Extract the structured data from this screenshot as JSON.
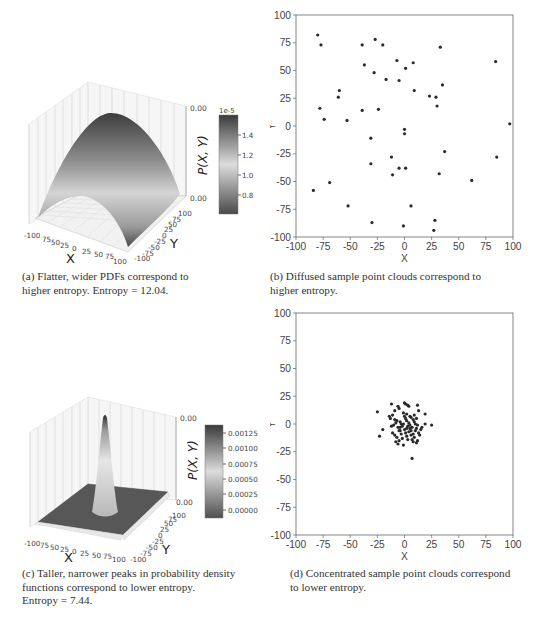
{
  "figure": {
    "panels": [
      {
        "id": "a",
        "caption": "(a) Flatter, wider PDFs correspond to higher entropy. Entropy = 12.04.",
        "caption_lines": [
          "(a) Flatter, wider PDFs correspond to",
          "higher entropy. Entropy = 12.04."
        ]
      },
      {
        "id": "b",
        "caption": "(b) Diffused sample point clouds correspond to higher entropy.",
        "caption_lines": [
          "(b) Diffused sample point clouds correspond to",
          "higher entropy."
        ]
      },
      {
        "id": "c",
        "caption": "(c) Taller, narrower peaks in probability density functions correspond to lower entropy. Entropy = 7.44.",
        "caption_lines": [
          "(c) Taller, narrower peaks in probability density",
          "functions correspond to lower entropy.",
          "Entropy = 7.44."
        ]
      },
      {
        "id": "d",
        "caption": "(d) Concentrated sample point clouds correspond to lower entropy.",
        "caption_lines": [
          "(d) Concentrated sample point clouds correspond",
          "to lower entropy."
        ]
      }
    ]
  },
  "chart_data": [
    {
      "panel": "a",
      "type": "surface3d",
      "title": "",
      "xlabel": "X",
      "ylabel": "Y",
      "zlabel_colorbar": "P(X, Y)",
      "x_ticks": [
        "-100",
        "75",
        "50",
        "25",
        "0",
        "25",
        "50",
        "75",
        "100"
      ],
      "y_ticks": [
        "-100",
        "-75",
        "-50",
        "-25",
        "0",
        "25",
        "50",
        "75",
        "100"
      ],
      "z_ticks": [
        "0.00",
        "0.00"
      ],
      "colorbar": {
        "offset_label": "1e-5",
        "ticks": [
          "1.4",
          "1.2",
          "1.0",
          "0.8"
        ],
        "range": [
          0.65,
          1.57
        ]
      },
      "description": "Broad Gaussian-like dome over [-100,100]^2"
    },
    {
      "panel": "b",
      "type": "scatter",
      "title": "",
      "xlabel": "X",
      "ylabel": "Y",
      "xlim": [
        -100,
        100
      ],
      "ylim": [
        -100,
        100
      ],
      "x_ticks": [
        "-100",
        "-75",
        "-50",
        "-25",
        "0",
        "25",
        "50",
        "75",
        "100"
      ],
      "y_ticks": [
        "100",
        "75",
        "50",
        "25",
        "0",
        "-25",
        "-50",
        "-75",
        "-100"
      ],
      "grid": false,
      "points": [
        [
          -80,
          82
        ],
        [
          -77,
          73
        ],
        [
          -78,
          16
        ],
        [
          -74,
          6
        ],
        [
          -60,
          32
        ],
        [
          -61,
          26
        ],
        [
          -53,
          5
        ],
        [
          -39,
          73
        ],
        [
          -37,
          55
        ],
        [
          -39,
          14
        ],
        [
          -27,
          78
        ],
        [
          -20,
          73
        ],
        [
          -28,
          48
        ],
        [
          -17,
          42
        ],
        [
          -24,
          15
        ],
        [
          -7,
          59
        ],
        [
          -5,
          41
        ],
        [
          1,
          52
        ],
        [
          8,
          57
        ],
        [
          9,
          32
        ],
        [
          33,
          71
        ],
        [
          35,
          37
        ],
        [
          23,
          27
        ],
        [
          29,
          26
        ],
        [
          30,
          18
        ],
        [
          84,
          58
        ],
        [
          97,
          2
        ],
        [
          0,
          -3
        ],
        [
          0,
          -7
        ],
        [
          -31,
          -11
        ],
        [
          -12,
          -28
        ],
        [
          37,
          -23
        ],
        [
          -31,
          -34
        ],
        [
          -5,
          -38
        ],
        [
          1,
          -38
        ],
        [
          -11,
          -44
        ],
        [
          32,
          -43
        ],
        [
          62,
          -49
        ],
        [
          85,
          -28
        ],
        [
          -69,
          -51
        ],
        [
          -84,
          -58
        ],
        [
          -52,
          -72
        ],
        [
          6,
          -72
        ],
        [
          -30,
          -87
        ],
        [
          -1,
          -90
        ],
        [
          28,
          -85
        ],
        [
          27,
          -94
        ]
      ]
    },
    {
      "panel": "c",
      "type": "surface3d",
      "title": "",
      "xlabel": "X",
      "ylabel": "Y",
      "zlabel_colorbar": "P(X, Y)",
      "x_ticks": [
        "-100",
        "75",
        "50",
        "25",
        "0",
        "25",
        "50",
        "75",
        "100"
      ],
      "y_ticks": [
        "-100",
        "-75",
        "-50",
        "-25",
        "0",
        "25",
        "50",
        "75",
        "100"
      ],
      "z_ticks": [
        "0.00",
        "0.00"
      ],
      "colorbar": {
        "ticks": [
          "0.00125",
          "0.00100",
          "0.00075",
          "0.00050",
          "0.00025",
          "0.00000"
        ],
        "range": [
          0,
          0.00145
        ]
      },
      "description": "Narrow tall peak centered near origin"
    },
    {
      "panel": "d",
      "type": "scatter",
      "title": "",
      "xlabel": "X",
      "ylabel": "Y",
      "xlim": [
        -100,
        100
      ],
      "ylim": [
        -100,
        100
      ],
      "x_ticks": [
        "-100",
        "-75",
        "-50",
        "-25",
        "0",
        "25",
        "50",
        "75",
        "100"
      ],
      "y_ticks": [
        "100",
        "75",
        "50",
        "25",
        "0",
        "-25",
        "-50",
        "-75",
        "-100"
      ],
      "grid": false,
      "points": [
        [
          -25,
          11
        ],
        [
          -23,
          -11
        ],
        [
          -20,
          -5
        ],
        [
          -12,
          18
        ],
        [
          -14,
          7
        ],
        [
          -13,
          5
        ],
        [
          -11,
          8
        ],
        [
          -9,
          4
        ],
        [
          -8,
          1
        ],
        [
          -10,
          -1
        ],
        [
          -12,
          -2
        ],
        [
          -11,
          -8
        ],
        [
          -9,
          -10
        ],
        [
          -8,
          -16
        ],
        [
          -6,
          -18
        ],
        [
          -5,
          -15
        ],
        [
          -6,
          16
        ],
        [
          -5,
          14
        ],
        [
          -4,
          2
        ],
        [
          -3,
          0
        ],
        [
          -7,
          3
        ],
        [
          -6,
          -3
        ],
        [
          -4,
          -6
        ],
        [
          -2,
          -13
        ],
        [
          0,
          19
        ],
        [
          1,
          18
        ],
        [
          3,
          17
        ],
        [
          4,
          16
        ],
        [
          0,
          7
        ],
        [
          1,
          5
        ],
        [
          2,
          3
        ],
        [
          3,
          -2
        ],
        [
          0,
          -5
        ],
        [
          1,
          -8
        ],
        [
          2,
          -11
        ],
        [
          -1,
          -19
        ],
        [
          3,
          -14
        ],
        [
          4,
          -7
        ],
        [
          5,
          -4
        ],
        [
          6,
          -6
        ],
        [
          7,
          -3
        ],
        [
          8,
          4
        ],
        [
          6,
          6
        ],
        [
          8,
          -9
        ],
        [
          9,
          -12
        ],
        [
          10,
          -6
        ],
        [
          11,
          -4
        ],
        [
          9,
          8
        ],
        [
          11,
          5
        ],
        [
          12,
          17
        ],
        [
          13,
          12
        ],
        [
          12,
          -1
        ],
        [
          13,
          -8
        ],
        [
          14,
          -10
        ],
        [
          12,
          -15
        ],
        [
          11,
          -17
        ],
        [
          15,
          -5
        ],
        [
          16,
          -3
        ],
        [
          19,
          9
        ],
        [
          19,
          0
        ],
        [
          25,
          -1
        ],
        [
          7,
          -31
        ],
        [
          -2,
          -2
        ],
        [
          -1,
          0
        ],
        [
          4,
          1
        ],
        [
          5,
          -1
        ],
        [
          2,
          -4
        ],
        [
          -3,
          -9
        ],
        [
          -5,
          -6
        ],
        [
          -7,
          -12
        ],
        [
          6,
          -10
        ],
        [
          7,
          -14
        ],
        [
          8,
          -16
        ],
        [
          10,
          0
        ],
        [
          9,
          2
        ],
        [
          -9,
          12
        ],
        [
          -1,
          10
        ],
        [
          2,
          9
        ],
        [
          5,
          7
        ],
        [
          -4,
          -3
        ]
      ]
    }
  ]
}
